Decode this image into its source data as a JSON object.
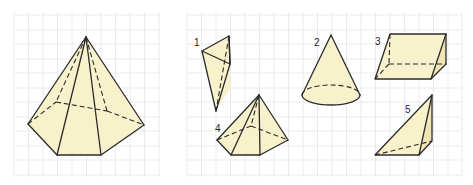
{
  "colors": {
    "face_fill": "#f8f2cc",
    "face_shade": "#efe6b4",
    "edge": "#2b2b2b",
    "grid": "#e6e6e6",
    "background": "#ffffff"
  },
  "panels": [
    {
      "name": "left-panel",
      "description": "Hexagonal pyramid on grid"
    },
    {
      "name": "right-panel",
      "description": "Five numbered solids on grid"
    }
  ],
  "main_figure": {
    "shape": "hexagonal pyramid",
    "label": ""
  },
  "figures": [
    {
      "number": "1",
      "shape": "triangular pyramid (tetrahedron)"
    },
    {
      "number": "2",
      "shape": "cone"
    },
    {
      "number": "3",
      "shape": "triangular prism"
    },
    {
      "number": "4",
      "shape": "pentagonal pyramid"
    },
    {
      "number": "5",
      "shape": "triangular pyramid"
    }
  ]
}
